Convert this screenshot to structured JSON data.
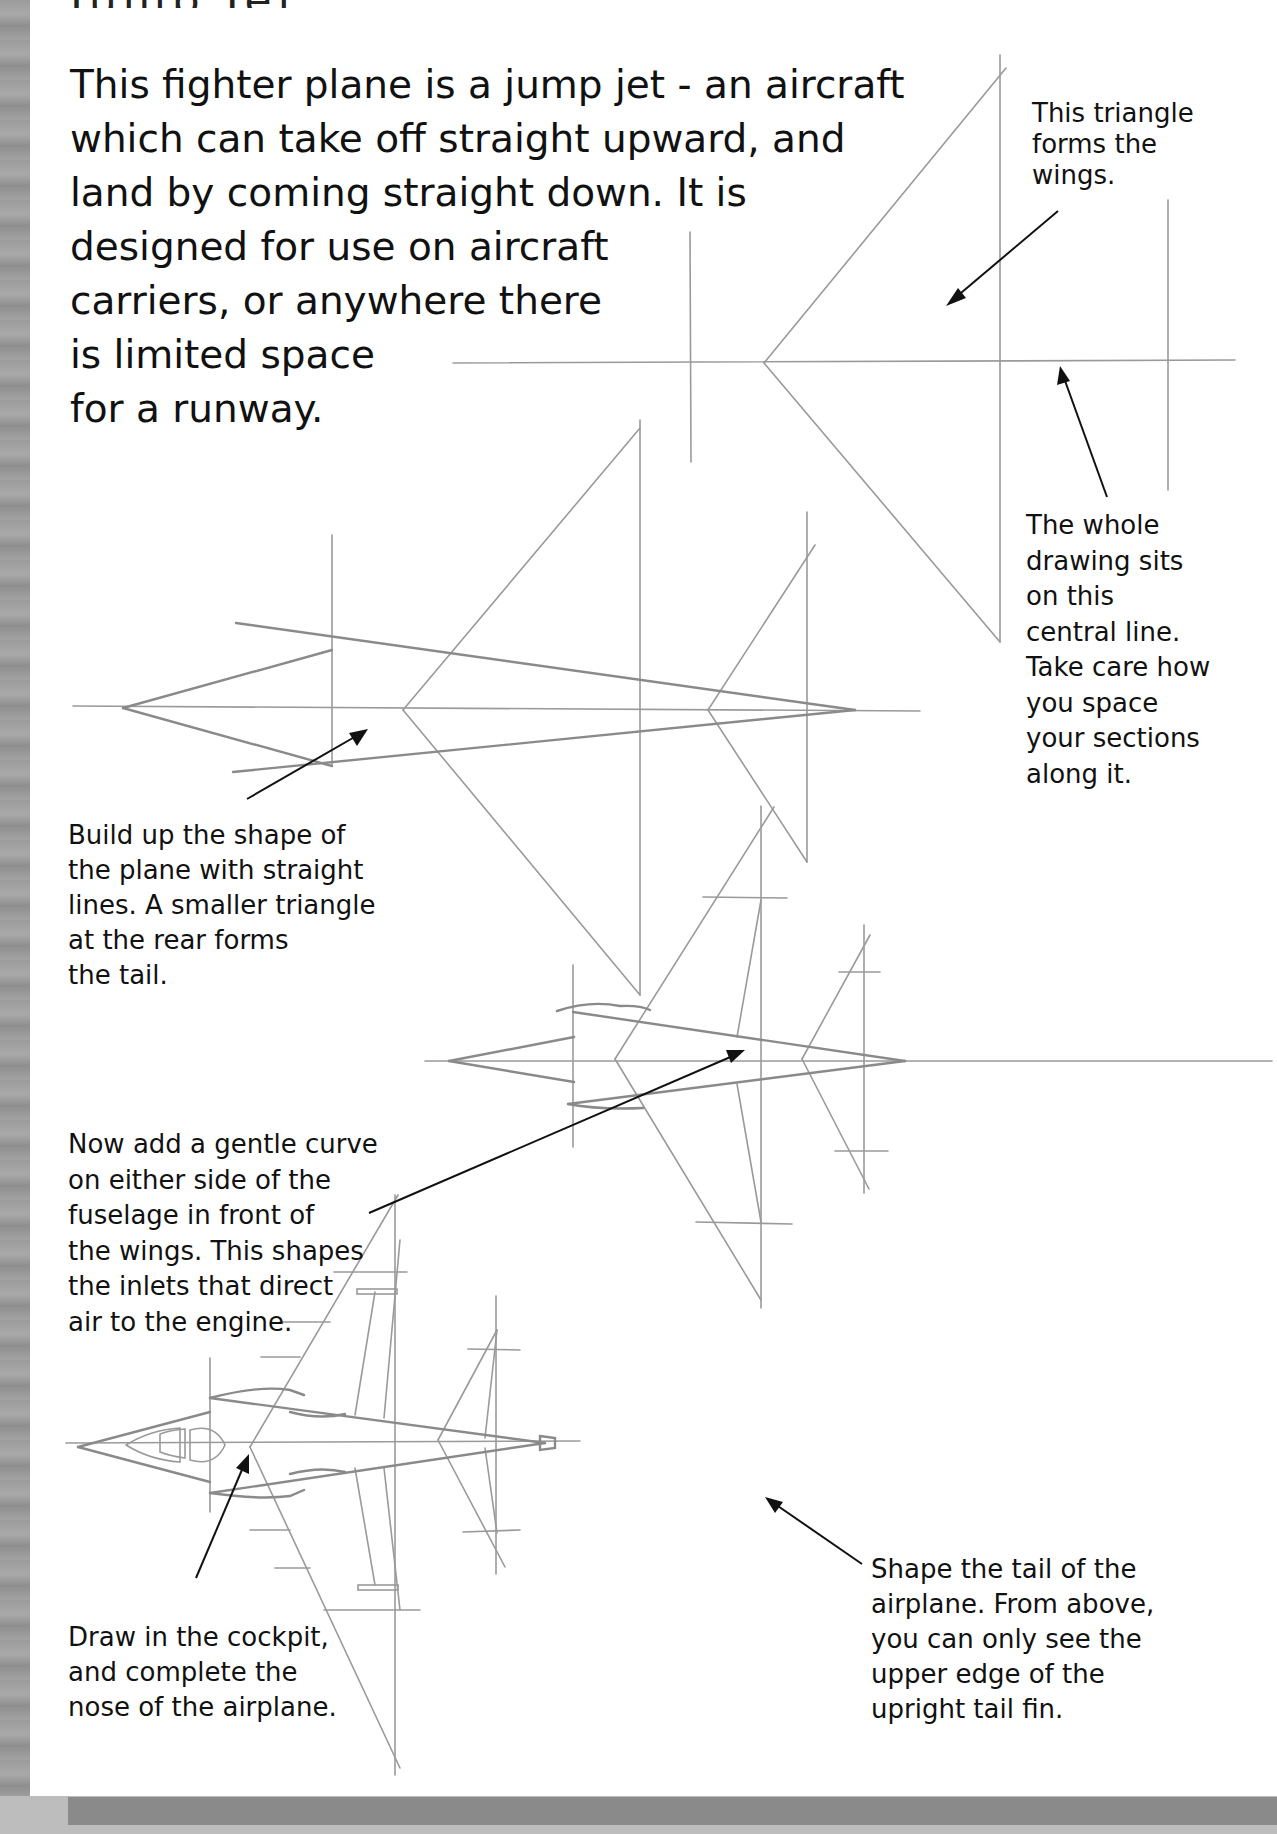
{
  "page": {
    "title_partial": "Jump Jet",
    "intro_lines": [
      "This fighter plane is a jump jet - an aircraft",
      "which can take off straight upward, and",
      "land by coming straight down. It is",
      "designed for use on aircraft",
      "carriers, or anywhere there",
      "is limited space",
      "for a runway."
    ]
  },
  "notes": {
    "wings": [
      "This triangle",
      "forms the",
      "wings."
    ],
    "central_line": [
      "The whole",
      "drawing sits",
      "on this",
      "central line.",
      "Take care how",
      "you space",
      "your sections",
      "along it."
    ],
    "build_up": [
      "Build up the shape of",
      "the plane with straight",
      "lines. A smaller triangle",
      "at the rear forms",
      "the tail."
    ],
    "inlets": [
      "Now add a gentle curve",
      "on either side of the",
      "fuselage in front of",
      "the wings. This shapes",
      "the inlets that direct",
      "air to the engine."
    ],
    "cockpit": [
      "Draw in the cockpit,",
      "and complete the",
      "nose of the airplane."
    ],
    "tail": [
      "Shape the tail of the",
      "airplane. From above,",
      "you can only see the",
      "upper edge of the",
      "upright tail fin."
    ]
  },
  "steps": [
    {
      "id": 1,
      "label": "wing triangle on central line"
    },
    {
      "id": 2,
      "label": "fuselage and tail triangle"
    },
    {
      "id": 3,
      "label": "intake curves"
    },
    {
      "id": 4,
      "label": "cockpit, nose and tail fin"
    }
  ],
  "colors": {
    "pencil": "#9a9a9a",
    "text": "#111111",
    "background": "#ffffff",
    "border_bar": "#8a8a8a"
  }
}
